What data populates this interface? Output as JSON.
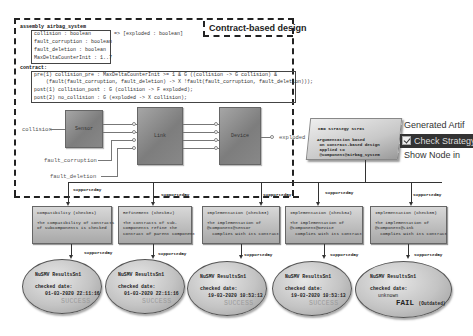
{
  "contract_region": {
    "title": "Contract-based design",
    "assembly_line": "assembly airbag_system",
    "inputs": [
      "collision : boolean",
      "fault_corruption : boolean",
      "fault_deletion : boolean",
      "MaxDeltaCounterInit : 1..7"
    ],
    "outputs": "=> [exploded : boolean]",
    "contract_label": "contract:",
    "contract_lines": [
      "pre(1) collision_pre : MaxDeltaCounterInit >= 1 & G ((collision -> G collision) &",
      "    (fault(fault_corruption, fault_deletion) -> X !fault(fault_corruption, fault_deletion)));",
      "post(1) collision_post : G (collision -> F exploded);",
      "post(2) no_collision : G (exploded -> X collision);"
    ]
  },
  "block_diagram": {
    "blocks": [
      "Sensor",
      "Link",
      "Device"
    ],
    "ports": {
      "collision": "collision",
      "fault_corruption": "fault_corruption",
      "fault_deletion": "fault_deletion",
      "exploded": "exploded"
    }
  },
  "strategy": {
    "title": "CBD Strategy Str01",
    "text": "Argumentation based\n on contract-based design\n applied to\n @component@airbag_system"
  },
  "context_menu": {
    "items": [
      {
        "label": "Generated Artif",
        "selected": false,
        "checked": false
      },
      {
        "label": "Check Strategy",
        "selected": true,
        "checked": true
      },
      {
        "label": "Show Node in",
        "selected": false,
        "checked": false
      }
    ]
  },
  "relation_label": "supportedBy",
  "goals": [
    {
      "title": "Compatibility (Check01)",
      "text": "The compatibility of contracts\nof subcomponents is checked"
    },
    {
      "title": "Refinement (Check02)",
      "text": "The contracts of sub-\ncomponents refine the\ncontract of parent component"
    },
    {
      "title": "Implementation (Check03)",
      "text": "The implementation of\n@component@Sensor\n  complies with its contract"
    },
    {
      "title": "Implementation (Check04)",
      "text": "The implementation of\n@component@Device\n  complies with its contract"
    },
    {
      "title": "Implementation (Check05)",
      "text": "The implementation of\n@component@Link\n  complies with its contract"
    }
  ],
  "results": [
    {
      "title": "NuSMV ResultsSn1",
      "date_label": "checked date:",
      "date": "01-03-2020 22:11:16",
      "status": "SUCCESS",
      "note": ""
    },
    {
      "title": "NuSMV ResultsSn1",
      "date_label": "checked date:",
      "date": "01-03-2020 22:11:16",
      "status": "SUCCESS",
      "note": ""
    },
    {
      "title": "NuSMV ResultsSn1",
      "date_label": "checked date:",
      "date": "19-03-2020 10:53:13",
      "status": "SUCCESS",
      "note": ""
    },
    {
      "title": "NuSMV ResultsSn1",
      "date_label": "checked date:",
      "date": "19-03-2020 10:53:13",
      "status": "SUCCESS",
      "note": ""
    },
    {
      "title": "NuSMV ResultsSn1",
      "date_label": "checked date:",
      "date": "unknown",
      "status": "FAIL",
      "note": "(Outdated)"
    }
  ],
  "colors": {
    "block_gray": "#8a8a8a",
    "menu_selected_bg": "#333333",
    "success_text": "#9a9a9a",
    "fail_text": "#222222"
  }
}
